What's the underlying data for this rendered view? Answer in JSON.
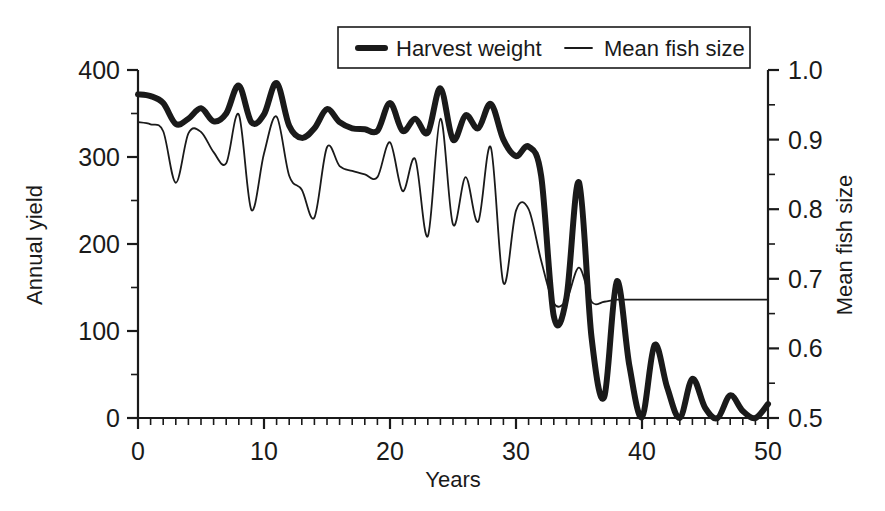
{
  "chart_data": {
    "type": "line",
    "title": "",
    "xlabel": "Years",
    "ylabel": "Annual yield",
    "y2label": "Mean fish size",
    "xlim": [
      0,
      50
    ],
    "ylim": [
      0,
      400
    ],
    "y2lim": [
      0.5,
      1.0
    ],
    "grid": false,
    "legend_position": "top-center",
    "x_ticks": [
      0,
      10,
      20,
      30,
      40,
      50
    ],
    "x_tick_labels": [
      "0",
      "10",
      "20",
      "30",
      "40",
      "50"
    ],
    "x_minor_interval": 1,
    "y_ticks": [
      0,
      100,
      200,
      300,
      400
    ],
    "y_tick_labels": [
      "0",
      "100",
      "200",
      "300",
      "400"
    ],
    "y_minor_interval": 50,
    "y2_ticks": [
      0.5,
      0.6,
      0.7,
      0.8,
      0.9,
      1.0
    ],
    "y2_tick_labels": [
      "0.5",
      "0.6",
      "0.7",
      "0.8",
      "0.9",
      "1.0"
    ],
    "y2_minor_interval": 0.05,
    "x": [
      0,
      1,
      2,
      3,
      4,
      5,
      6,
      7,
      8,
      9,
      10,
      11,
      12,
      13,
      14,
      15,
      16,
      17,
      18,
      19,
      20,
      21,
      22,
      23,
      24,
      25,
      26,
      27,
      28,
      29,
      30,
      31,
      32,
      33,
      34,
      35,
      36,
      37,
      38,
      39,
      40,
      41,
      42,
      43,
      44,
      45,
      46,
      47,
      48,
      49,
      50
    ],
    "series": [
      {
        "name": "Harvest weight",
        "axis": "left",
        "line_width": 6,
        "color": "#1a1a1a",
        "values": [
          372,
          370,
          362,
          338,
          344,
          356,
          341,
          350,
          382,
          340,
          349,
          385,
          336,
          322,
          333,
          355,
          340,
          333,
          332,
          330,
          362,
          330,
          344,
          328,
          379,
          320,
          348,
          333,
          361,
          320,
          301,
          312,
          278,
          117,
          138,
          271,
          92,
          24,
          157,
          60,
          1,
          84,
          35,
          0,
          45,
          12,
          0,
          26,
          8,
          0,
          16
        ]
      },
      {
        "name": "Mean fish size",
        "axis": "right",
        "line_width": 1.8,
        "color": "#1a1a1a",
        "values": [
          0.925,
          0.922,
          0.912,
          0.838,
          0.909,
          0.911,
          0.882,
          0.866,
          0.936,
          0.799,
          0.88,
          0.933,
          0.848,
          0.828,
          0.788,
          0.889,
          0.862,
          0.855,
          0.85,
          0.846,
          0.896,
          0.826,
          0.872,
          0.761,
          0.93,
          0.778,
          0.846,
          0.782,
          0.889,
          0.694,
          0.798,
          0.8,
          0.726,
          0.665,
          0.669,
          0.716,
          0.667,
          0.667,
          0.67,
          0.67,
          0.67,
          0.67,
          0.67,
          0.67,
          0.67,
          0.67,
          0.67,
          0.67,
          0.67,
          0.67,
          0.67
        ]
      }
    ],
    "annotations": [
      {
        "text": "Mean fish size flattens to a constant plateau of about 0.67 after year 38",
        "kind": "plateau"
      }
    ]
  },
  "legend": {
    "items": [
      {
        "label": "Harvest weight",
        "swatch": "thick-line-swatch"
      },
      {
        "label": "Mean fish size",
        "swatch": "thin-line-swatch"
      }
    ]
  }
}
